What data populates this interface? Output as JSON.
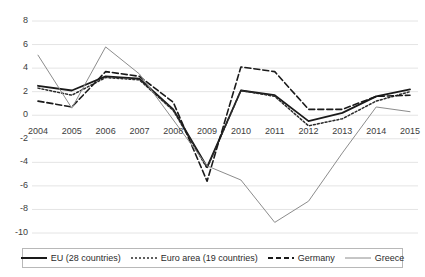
{
  "chart_data": {
    "type": "line",
    "title": "",
    "xlabel": "",
    "ylabel": "",
    "categories": [
      "2004",
      "2005",
      "2006",
      "2007",
      "2008",
      "2009",
      "2010",
      "2011",
      "2012",
      "2013",
      "2014",
      "2015"
    ],
    "ylim": [
      -10,
      8
    ],
    "yticks": [
      8,
      6,
      4,
      2,
      0,
      -2,
      -4,
      -6,
      -8,
      -10
    ],
    "grid": true,
    "legend_position": "bottom",
    "series": [
      {
        "name": "EU (28 countries)",
        "style": "solid",
        "color": "#1a1a1a",
        "width": 1.8,
        "values": [
          2.5,
          2.1,
          3.3,
          3.1,
          0.5,
          -4.4,
          2.1,
          1.7,
          -0.5,
          0.2,
          1.6,
          2.2
        ]
      },
      {
        "name": "Euro area (19 countries)",
        "style": "dotted",
        "color": "#2b2b2b",
        "width": 1.5,
        "values": [
          2.3,
          1.7,
          3.2,
          3.0,
          0.4,
          -4.5,
          2.1,
          1.6,
          -0.9,
          -0.3,
          1.2,
          2.0
        ]
      },
      {
        "name": "Germany",
        "style": "dashed",
        "color": "#1a1a1a",
        "width": 1.6,
        "values": [
          1.2,
          0.7,
          3.7,
          3.3,
          1.1,
          -5.6,
          4.1,
          3.7,
          0.5,
          0.5,
          1.6,
          1.7
        ]
      },
      {
        "name": "Greece",
        "style": "solid",
        "color": "#8c8c8c",
        "width": 1.0,
        "values": [
          5.1,
          0.6,
          5.8,
          3.5,
          -0.4,
          -4.3,
          -5.5,
          -9.1,
          -7.3,
          -3.2,
          0.7,
          0.3
        ]
      }
    ]
  },
  "axis": {
    "y_tick_labels": [
      "8",
      "6",
      "4",
      "2",
      "0",
      "-2",
      "-4",
      "-6",
      "-8",
      "-10"
    ],
    "x_tick_labels": [
      "2004",
      "2005",
      "2006",
      "2007",
      "2008",
      "2009",
      "2010",
      "2011",
      "2012",
      "2013",
      "2014",
      "2015"
    ]
  },
  "legend": {
    "items": [
      {
        "label": "EU (28 countries)",
        "style": "solid-thick",
        "color": "#1a1a1a"
      },
      {
        "label": "Euro area (19 countries)",
        "style": "dotted",
        "color": "#2b2b2b"
      },
      {
        "label": "Germany",
        "style": "dashed",
        "color": "#1a1a1a"
      },
      {
        "label": "Greece",
        "style": "solid-thin",
        "color": "#8c8c8c"
      }
    ]
  },
  "colors": {
    "grid": "#e4e4e4",
    "axis_text": "#3c3c3c",
    "background": "#ffffff",
    "legend_border": "#b8b8b8"
  }
}
